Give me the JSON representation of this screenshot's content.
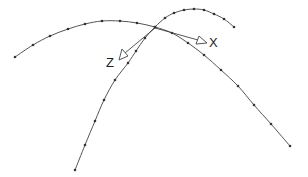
{
  "diagram": {
    "axes": {
      "x_label": "X",
      "z_label": "Z"
    },
    "colors": {
      "curve": "#555555",
      "dot": "#333333",
      "axis": "#444444",
      "background": "#ffffff"
    },
    "curves": [
      {
        "name": "curve-a",
        "points": [
          [
            15,
            57
          ],
          [
            33,
            45
          ],
          [
            50,
            36
          ],
          [
            68,
            29
          ],
          [
            85,
            24
          ],
          [
            102,
            21
          ],
          [
            120,
            21
          ],
          [
            137,
            23
          ],
          [
            155,
            27
          ],
          [
            172,
            33
          ],
          [
            188,
            43
          ],
          [
            204,
            55
          ],
          [
            221,
            70
          ],
          [
            238,
            86
          ],
          [
            254,
            105
          ],
          [
            271,
            124
          ],
          [
            290,
            146
          ]
        ]
      },
      {
        "name": "curve-b",
        "points": [
          [
            75,
            170
          ],
          [
            85,
            145
          ],
          [
            95,
            121
          ],
          [
            104,
            100
          ],
          [
            115,
            80
          ],
          [
            128,
            63
          ],
          [
            136,
            51
          ],
          [
            145,
            38
          ],
          [
            155,
            27
          ],
          [
            165,
            18
          ],
          [
            174,
            13
          ],
          [
            184,
            10
          ],
          [
            194,
            9
          ],
          [
            204,
            10
          ],
          [
            214,
            14
          ],
          [
            224,
            19
          ],
          [
            234,
            27
          ]
        ]
      }
    ],
    "origin": [
      155,
      28
    ]
  }
}
